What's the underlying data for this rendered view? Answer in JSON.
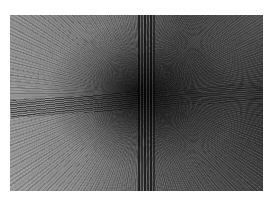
{
  "image": {
    "description": "Grayscale abstract zoom-burst photograph with radial motion streaks converging at a dark center, crossed by a vertical dark band and a horizontal dark band, on a white margin",
    "palette": {
      "background": "#ffffff",
      "light_tone": "#9a9a9a",
      "mid_tone": "#7d7d7d",
      "dark_tone": "#2c2c2c",
      "center": "#0a0a0a"
    }
  }
}
